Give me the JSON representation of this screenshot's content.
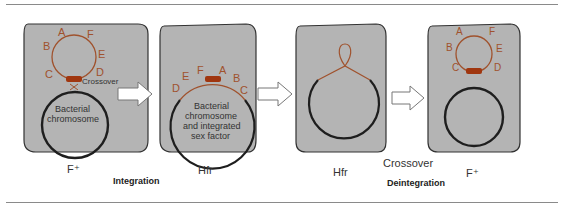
{
  "colors": {
    "cell_fill": "#b4b4b4",
    "cell_stroke": "#333333",
    "plasmid": "#a0522d",
    "f_marker": "#a0360f",
    "chromosome": "#1e1e1e",
    "label_text": "#a0522d"
  },
  "panels": [
    {
      "caption": "F⁺",
      "genes": [
        "A",
        "B",
        "C",
        "D",
        "E",
        "F"
      ],
      "crossover_label": "Crossover",
      "chromosome_text": [
        "Bacterial",
        "chromosome"
      ]
    },
    {
      "caption": "Hfr",
      "genes": [
        "D",
        "E",
        "F",
        "A",
        "B",
        "C"
      ],
      "chromosome_text": [
        "Bacterial",
        "chromosome",
        "and integrated",
        "sex factor"
      ]
    },
    {
      "caption": "Hfr"
    },
    {
      "caption": "F⁺",
      "genes": [
        "A",
        "B",
        "C",
        "D",
        "E",
        "F"
      ]
    }
  ],
  "transitions": [
    {
      "label": "Integration"
    },
    {
      "label": "",
      "icon": "arrow-right-icon"
    },
    {
      "label_top": "Crossover",
      "label": "Deintegration"
    }
  ]
}
